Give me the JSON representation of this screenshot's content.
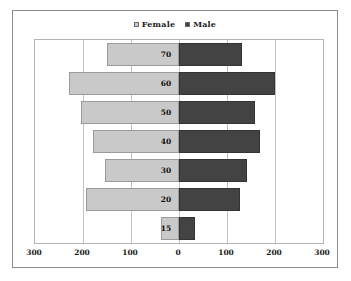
{
  "chart_data": {
    "type": "bar",
    "subtype": "population-pyramid",
    "title": "",
    "xlabel": "",
    "ylabel": "",
    "categories": [
      "70",
      "60",
      "50",
      "40",
      "30",
      "20",
      "15"
    ],
    "series": [
      {
        "name": "Female",
        "color": "#c9c9c9",
        "values": [
          151,
          230,
          205,
          180,
          155,
          193,
          37
        ],
        "direction": "left"
      },
      {
        "name": "Male",
        "color": "#434343",
        "values": [
          131,
          200,
          158,
          168,
          141,
          127,
          33
        ],
        "direction": "right"
      }
    ],
    "x_ticks": [
      "300",
      "200",
      "100",
      "0",
      "100",
      "200",
      "300"
    ],
    "x_tick_values": [
      -300,
      -200,
      -100,
      0,
      100,
      200,
      300
    ],
    "xlim": [
      -300,
      300
    ],
    "grid": true,
    "legend_position": "top-center",
    "legend": [
      {
        "label": "Female",
        "color": "#c9c9c9"
      },
      {
        "label": "Male",
        "color": "#434343"
      }
    ]
  },
  "colors": {
    "female": "#c9c9c9",
    "male": "#434343",
    "frame_border": "#8d8d8d",
    "plot_border": "#b4b4b4",
    "gridline": "#c3c3c3",
    "background": "#ffffff",
    "text": "#1a1a1a"
  }
}
